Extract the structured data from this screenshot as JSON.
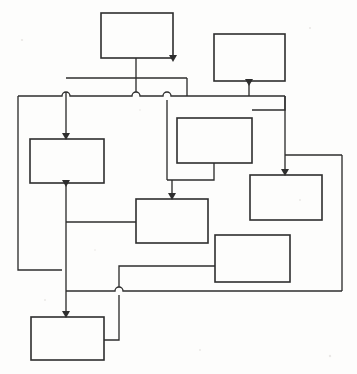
{
  "diagram": {
    "type": "block-flow-diagram",
    "canvas": {
      "width": 357,
      "height": 374
    },
    "style": {
      "background_color": "#fdfdfc",
      "stroke_color": "#2e2e2e",
      "node_fill": "none",
      "node_stroke_width": 1.6,
      "edge_stroke_width": 1.35,
      "line_routing": "orthogonal",
      "crossing_style": "hop-arc",
      "arrowhead_style": "solid-filled-triangle"
    },
    "nodes": [
      {
        "id": "n1",
        "label": "",
        "x": 101,
        "y": 13,
        "width": 72,
        "height": 45,
        "position": "top-center-left"
      },
      {
        "id": "n2",
        "label": "",
        "x": 214,
        "y": 34,
        "width": 71,
        "height": 47,
        "position": "top-right"
      },
      {
        "id": "n3",
        "label": "",
        "x": 30,
        "y": 139,
        "width": 74,
        "height": 44,
        "position": "left-middle"
      },
      {
        "id": "n4",
        "label": "",
        "x": 177,
        "y": 118,
        "width": 75,
        "height": 45,
        "position": "center-upper"
      },
      {
        "id": "n5",
        "label": "",
        "x": 250,
        "y": 175,
        "width": 72,
        "height": 45,
        "position": "right-middle"
      },
      {
        "id": "n6",
        "label": "",
        "x": 136,
        "y": 199,
        "width": 72,
        "height": 44,
        "position": "center-lower"
      },
      {
        "id": "n7",
        "label": "",
        "x": 215,
        "y": 235,
        "width": 75,
        "height": 47,
        "position": "lower-right"
      },
      {
        "id": "n8",
        "label": "",
        "x": 31,
        "y": 317,
        "width": 73,
        "height": 43,
        "position": "bottom-left"
      }
    ],
    "edges": [
      {
        "id": "e1",
        "from": "n1",
        "to": "bus",
        "arrow": false,
        "points": "136,58 136,96"
      },
      {
        "id": "e2",
        "from": "n2",
        "to": "n5",
        "arrow": true,
        "points": "249,81 249,96 285,96 285,175"
      },
      {
        "id": "e3",
        "from": "bus",
        "to": "n3",
        "arrow": true,
        "points": "66,78 66,96 66,139"
      },
      {
        "id": "e4",
        "from": "bus",
        "to": "n6",
        "arrow": false,
        "points": "167,96 167,180"
      },
      {
        "id": "e5",
        "from": "n4",
        "to": "n6",
        "arrow": true,
        "points": "214,163 214,180 172,180 172,199"
      },
      {
        "id": "e6",
        "from": "n3",
        "to": "n8",
        "arrow": true,
        "points": "66,183 66,291 66,317"
      },
      {
        "id": "e7",
        "from": "n6",
        "to": "left",
        "arrow": false,
        "points": "136,222 66,222"
      },
      {
        "id": "e8",
        "from": "left",
        "to": "bus",
        "arrow": false,
        "points": "18,96 18,270 66,270"
      },
      {
        "id": "e9",
        "from": "n7",
        "to": "n8",
        "arrow": false,
        "points": "215,266 119,266 119,340 104,340"
      },
      {
        "id": "e10",
        "from": "right",
        "to": "bus",
        "arrow": false,
        "points": "342,155 342,291 119,291"
      },
      {
        "id": "e11",
        "from": "bus",
        "to": "right",
        "arrow": false,
        "points": "66,78 187,78 187,96"
      },
      {
        "id": "e12",
        "from": "n4",
        "to": "right",
        "arrow": false,
        "points": "285,110 285,96"
      }
    ],
    "bus_line": {
      "id": "main-bus",
      "y": 96,
      "x_start": 18,
      "x_end": 285
    },
    "hops": [
      {
        "x": 66,
        "y": 96
      },
      {
        "x": 136,
        "y": 96
      },
      {
        "x": 167,
        "y": 96
      },
      {
        "x": 119,
        "y": 291
      }
    ],
    "arrow_heads": [
      {
        "id": "a1",
        "x": 66,
        "y": 139,
        "direction": "down",
        "target": "n3"
      },
      {
        "id": "a2",
        "x": 172,
        "y": 199,
        "direction": "down",
        "target": "n6"
      },
      {
        "id": "a3",
        "x": 285,
        "y": 175,
        "direction": "down",
        "target": "n5"
      },
      {
        "id": "a4",
        "x": 66,
        "y": 317,
        "direction": "down",
        "target": "n8"
      },
      {
        "id": "a5",
        "x": 66,
        "y": 183,
        "direction": "down",
        "target": "n3-out"
      },
      {
        "id": "a6",
        "x": 249,
        "y": 81,
        "direction": "down",
        "target": "n2-out"
      },
      {
        "id": "a7",
        "x": 173,
        "y": 58,
        "direction": "down",
        "target": "n1-out"
      }
    ],
    "counts": {
      "nodes": 8,
      "edges": 12,
      "crossing_hops": 4,
      "arrow_heads": 7
    }
  }
}
